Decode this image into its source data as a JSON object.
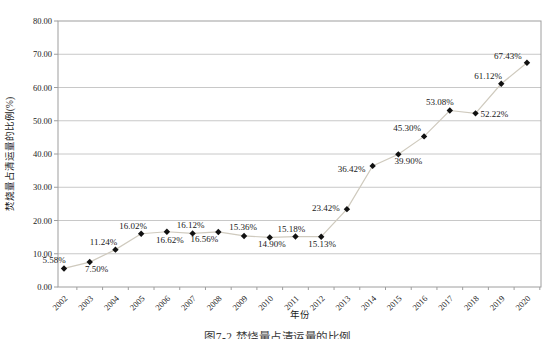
{
  "figure": {
    "caption": "图7-2  焚烧量占清运量的比例"
  },
  "chart_data": {
    "type": "line",
    "title": "",
    "xlabel": "年份",
    "ylabel": "焚烧量占清运量的比例(%)",
    "categories": [
      "2002",
      "2003",
      "2004",
      "2005",
      "2006",
      "2007",
      "2008",
      "2009",
      "2010",
      "2011",
      "2012",
      "2013",
      "2014",
      "2015",
      "2016",
      "2017",
      "2018",
      "2019",
      "2020"
    ],
    "series": [
      {
        "name": "焚烧量占清运量的比例",
        "values": [
          5.58,
          7.5,
          11.24,
          16.02,
          16.62,
          16.12,
          16.56,
          15.36,
          14.9,
          15.18,
          15.13,
          23.42,
          36.42,
          39.9,
          45.3,
          53.08,
          52.22,
          61.12,
          67.43
        ],
        "point_labels": [
          "5.58%",
          "7.50%",
          "11.24%",
          "16.02%",
          "16.62%",
          "16.12%",
          "16.56%",
          "15.36%",
          "14.90%",
          "15.18%",
          "15.13%",
          "23.42%",
          "36.42%",
          "39.90%",
          "45.30%",
          "53.08%",
          "52.22%",
          "61.12%",
          "67.43%"
        ]
      }
    ],
    "ylim": [
      0,
      80
    ],
    "ytick_interval": 10,
    "ytick_labels": [
      "0.00",
      "10.00",
      "20.00",
      "30.00",
      "40.00",
      "50.00",
      "60.00",
      "70.00",
      "80.00"
    ],
    "grid": true,
    "legend": false,
    "marker": "diamond",
    "label_placement": [
      [
        -10,
        -5,
        "middle"
      ],
      [
        7,
        10,
        "middle"
      ],
      [
        -12,
        -5,
        "middle"
      ],
      [
        -8,
        -5,
        "middle"
      ],
      [
        3,
        11,
        "middle"
      ],
      [
        -2,
        -5,
        "middle"
      ],
      [
        -14,
        10,
        "middle"
      ],
      [
        -1,
        -6,
        "middle"
      ],
      [
        2,
        10,
        "middle"
      ],
      [
        -4,
        -5,
        "middle"
      ],
      [
        1,
        10,
        "middle"
      ],
      [
        -21,
        2,
        "middle"
      ],
      [
        -21,
        6,
        "middle"
      ],
      [
        10,
        10,
        "middle"
      ],
      [
        -17,
        -5,
        "middle"
      ],
      [
        -10,
        -6,
        "middle"
      ],
      [
        5,
        4,
        "start"
      ],
      [
        -13,
        -5,
        "middle"
      ],
      [
        -19,
        -4,
        "middle"
      ]
    ],
    "colors": {
      "line": "#cfcabe",
      "marker": "#111111",
      "grid": "#bababa",
      "axis": "#9e9e9e",
      "text": "#1a1a1a"
    }
  }
}
